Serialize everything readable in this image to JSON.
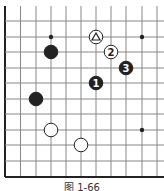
{
  "diagram": {
    "type": "go-board-fragment",
    "caption": "图 1-66",
    "grid": {
      "x": [
        5,
        20.5,
        36,
        51,
        66,
        81,
        96,
        111,
        126,
        142,
        157
      ],
      "y": [
        6,
        21,
        37,
        52,
        68,
        83,
        99,
        114,
        130,
        145,
        161,
        177
      ],
      "left_edge_thick": true,
      "bottom_edge_thick": true,
      "line_color": "#888888",
      "edge_color": "#222222"
    },
    "star_points": [
      [
        51,
        37
      ],
      [
        142,
        37
      ],
      [
        142,
        130
      ]
    ],
    "stones": [
      {
        "color": "white",
        "x": 96,
        "y": 37,
        "label": "△",
        "marker": "triangle"
      },
      {
        "color": "white",
        "x": 111,
        "y": 52,
        "label": "2"
      },
      {
        "color": "black",
        "x": 126,
        "y": 68,
        "label": "3"
      },
      {
        "color": "black",
        "x": 96,
        "y": 83,
        "label": "1"
      },
      {
        "color": "black",
        "x": 51,
        "y": 52,
        "label": ""
      },
      {
        "color": "black",
        "x": 36,
        "y": 99,
        "label": ""
      },
      {
        "color": "white",
        "x": 51,
        "y": 130,
        "label": ""
      },
      {
        "color": "white",
        "x": 81,
        "y": 145,
        "label": ""
      }
    ]
  }
}
